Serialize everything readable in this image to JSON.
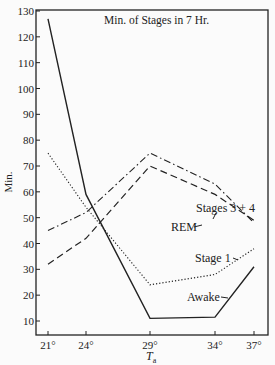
{
  "chart_data": {
    "type": "line",
    "title": "Min. of Stages in 7 Hr.",
    "xlabel": "T_a",
    "ylabel": "Min.",
    "x": [
      "21°",
      "24°",
      "29°",
      "34°",
      "37°"
    ],
    "x_values": [
      21,
      24,
      29,
      34,
      37
    ],
    "ylim": [
      5,
      130
    ],
    "yticks": [
      10,
      20,
      30,
      40,
      50,
      60,
      70,
      80,
      90,
      100,
      110,
      120,
      130
    ],
    "grid": false,
    "legend": "inline labels",
    "series": [
      {
        "name": "Awake",
        "style": "solid",
        "values": [
          127,
          59,
          11,
          11.5,
          31
        ]
      },
      {
        "name": "Stage 1",
        "style": "dotted",
        "values": [
          75,
          54,
          24,
          28,
          38
        ]
      },
      {
        "name": "Stages 3 + 4",
        "style": "dash-dot",
        "values": [
          45,
          52,
          75,
          63,
          48
        ]
      },
      {
        "name": "REM",
        "style": "dashed",
        "values": [
          32,
          42,
          70,
          59,
          49
        ]
      }
    ]
  },
  "labels": {
    "title": "Min. of Stages in 7 Hr.",
    "ylabel": "Min.",
    "xlabel_main": "T",
    "xlabel_sub": "a",
    "awake": "Awake",
    "stage1": "Stage 1",
    "stages34": "Stages 3 + 4",
    "rem": "REM"
  }
}
